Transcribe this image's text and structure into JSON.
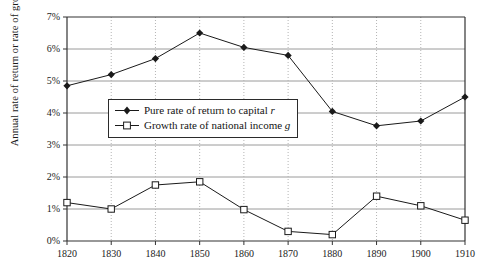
{
  "chart_data": {
    "type": "line",
    "title": "",
    "xlabel": "",
    "ylabel": "Annual rate of return or rate of growth",
    "x": [
      1820,
      1830,
      1840,
      1850,
      1860,
      1870,
      1880,
      1890,
      1900,
      1910
    ],
    "xticklabels": [
      "1820",
      "1830",
      "1840",
      "1850",
      "1860",
      "1870",
      "1880",
      "1890",
      "1900",
      "1910"
    ],
    "yticklabels": [
      "0%",
      "1%",
      "2%",
      "3%",
      "4%",
      "5%",
      "6%",
      "7%"
    ],
    "yticks": [
      0,
      1,
      2,
      3,
      4,
      5,
      6,
      7
    ],
    "ylim": [
      0,
      7
    ],
    "xlim": [
      1820,
      1910
    ],
    "grid": "horizontal solid gridlines plus vertical dotted gridlines at each decade",
    "legend_position": "center-left inside plot area",
    "series": [
      {
        "name": "Pure rate of return to capital r",
        "symbol": "filled-diamond",
        "color": "#1a1a1a",
        "values": [
          4.85,
          5.2,
          5.7,
          6.5,
          6.05,
          5.8,
          4.05,
          3.6,
          3.75,
          4.5
        ]
      },
      {
        "name": "Growth rate of national income g",
        "symbol": "open-square",
        "color": "#1a1a1a",
        "values": [
          1.2,
          1.0,
          1.75,
          1.85,
          0.98,
          0.3,
          0.2,
          1.4,
          1.1,
          0.65
        ]
      }
    ]
  },
  "legend": {
    "items": [
      {
        "label_main": "Pure rate of return to capital",
        "label_italic": "r"
      },
      {
        "label_main": "Growth rate of national income",
        "label_italic": "g"
      }
    ]
  }
}
